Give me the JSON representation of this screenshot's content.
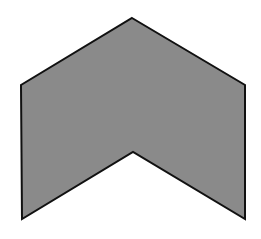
{
  "diagram": {
    "shape": "chevron-up",
    "fill_color": "#8a8a8a",
    "stroke_color": "#111111",
    "stroke_width": 2,
    "background_color": "#ffffff",
    "vertices": [
      [
        132,
        18
      ],
      [
        245,
        85
      ],
      [
        245,
        219
      ],
      [
        133,
        152
      ],
      [
        22,
        219
      ],
      [
        21,
        85
      ]
    ]
  }
}
